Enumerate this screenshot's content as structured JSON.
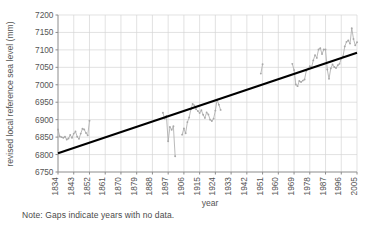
{
  "chart_data": {
    "type": "line",
    "title": "",
    "xlabel": "year",
    "ylabel": "revised local reference sea level (mm)",
    "xlim": [
      1834,
      2005
    ],
    "ylim": [
      6750,
      7200
    ],
    "grid": true,
    "legend": null,
    "xticks": [
      1834,
      1843,
      1852,
      1861,
      1870,
      1879,
      1888,
      1897,
      1906,
      1915,
      1924,
      1933,
      1942,
      1951,
      1960,
      1969,
      1978,
      1987,
      1996,
      2005
    ],
    "yticks": [
      6750,
      6800,
      6850,
      6900,
      6950,
      7000,
      7050,
      7100,
      7150,
      7200
    ],
    "series": [
      {
        "name": "revised local reference sea level",
        "color": "#a8a8a8",
        "marker": "dot",
        "segments": [
          {
            "x": [
              1834,
              1835,
              1836,
              1837,
              1838,
              1839,
              1840,
              1841,
              1842,
              1843,
              1844,
              1845,
              1846,
              1847,
              1848,
              1849,
              1850,
              1851,
              1852
            ],
            "y": [
              6872,
              6852,
              6850,
              6848,
              6851,
              6843,
              6846,
              6856,
              6848,
              6860,
              6866,
              6851,
              6845,
              6860,
              6874,
              6872,
              6862,
              6855,
              6897
            ]
          },
          {
            "x": [
              1894,
              1895,
              1896,
              1897,
              1898,
              1899,
              1900,
              1901
            ],
            "y": [
              6920,
              6903,
              6911,
              6838,
              6879,
              6871,
              6881,
              6795
            ]
          },
          {
            "x": [
              1905,
              1906,
              1907,
              1908,
              1909,
              1910,
              1911,
              1912,
              1913,
              1914,
              1915,
              1916,
              1917,
              1918,
              1919,
              1920,
              1921,
              1922,
              1923,
              1924,
              1925,
              1926,
              1927
            ],
            "y": [
              6857,
              6875,
              6861,
              6893,
              6906,
              6930,
              6945,
              6941,
              6930,
              6925,
              6919,
              6927,
              6914,
              6905,
              6921,
              6915,
              6900,
              6896,
              6903,
              6926,
              6957,
              6943,
              6928
            ]
          },
          {
            "x": [
              1950,
              1951
            ],
            "y": [
              7032,
              7059
            ]
          },
          {
            "x": [
              1968,
              1969,
              1970,
              1971,
              1972,
              1973,
              1974,
              1975,
              1976,
              1977,
              1978,
              1979,
              1980,
              1981,
              1982,
              1983,
              1984,
              1985,
              1986,
              1987,
              1988,
              1989,
              1990,
              1991,
              1992,
              1993,
              1994,
              1995,
              1996,
              1997,
              1998,
              1999,
              2000,
              2001,
              2002,
              2003,
              2004,
              2005
            ],
            "y": [
              7060,
              7042,
              7001,
              6996,
              7011,
              7008,
              7012,
              7015,
              7040,
              7045,
              7053,
              7050,
              7070,
              7085,
              7077,
              7101,
              7105,
              7088,
              7101,
              7101,
              7044,
              7017,
              7047,
              7058,
              7051,
              7048,
              7056,
              7060,
              7075,
              7081,
              7110,
              7123,
              7127,
              7118,
              7162,
              7131,
              7113,
              7122
            ]
          }
        ]
      }
    ],
    "trendline": {
      "name": "linear trend",
      "color": "#000000",
      "x": [
        1834,
        2005
      ],
      "y": [
        6804,
        7092
      ]
    },
    "note": "Note: Gaps indicate years with no data."
  },
  "axes": {
    "xlabel": "year",
    "ylabel": "revised local reference sea level (mm)"
  },
  "note_text": "Note: Gaps indicate years with no data."
}
